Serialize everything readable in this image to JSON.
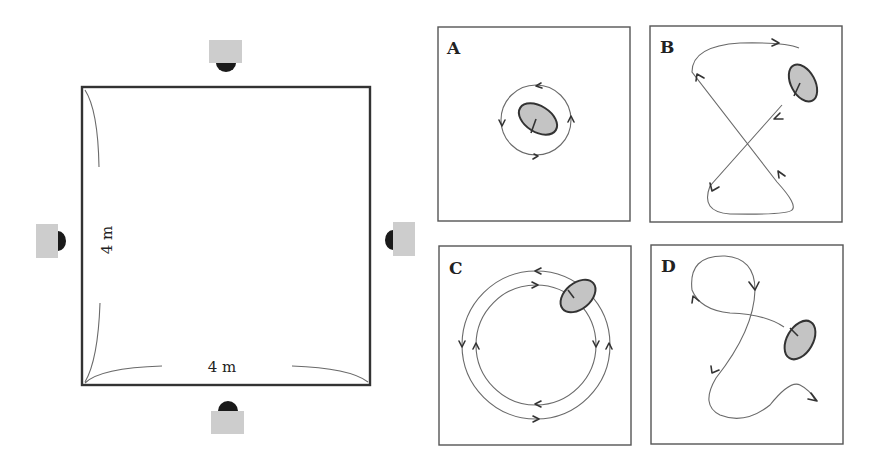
{
  "room": {
    "width_label": "4 m",
    "height_label": "4 m",
    "cameras": [
      {
        "position": "top",
        "name": "camera-top"
      },
      {
        "position": "left",
        "name": "camera-left"
      },
      {
        "position": "right",
        "name": "camera-right"
      },
      {
        "position": "bottom",
        "name": "camera-bottom"
      }
    ]
  },
  "panels": [
    {
      "letter": "A",
      "pattern": "small circular path around object"
    },
    {
      "letter": "B",
      "pattern": "figure-eight path crossing the room"
    },
    {
      "letter": "C",
      "pattern": "two concentric circular paths in opposite directions"
    },
    {
      "letter": "D",
      "pattern": "irregular meandering path"
    }
  ],
  "colors": {
    "object_fill": "#c4c4c4",
    "camera_body": "#cdcdcd",
    "camera_lens": "#1a1a1a",
    "line": "#6a6a6a"
  }
}
